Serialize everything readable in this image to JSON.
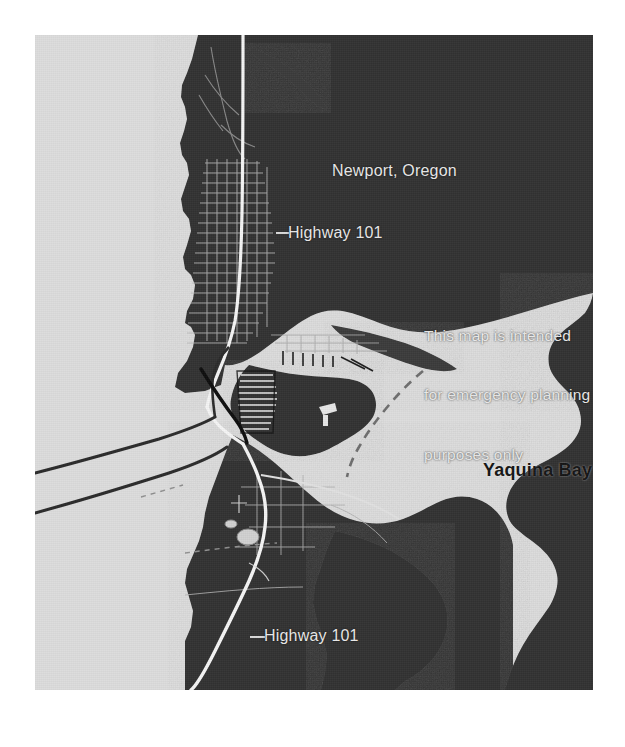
{
  "document": {
    "type": "scanned-map-figure",
    "page_background": "#ffffff"
  },
  "map": {
    "title": "Newport, Oregon",
    "region": "Newport, Oregon — Yaquina Bay",
    "frame": {
      "left": 35,
      "top": 35,
      "width": 558,
      "height": 655
    },
    "colors": {
      "land": "#333333",
      "water": "#dcdcdc",
      "road_highway": "#f2f2f2",
      "road_street": "#bdbdbd",
      "jetty": "#2a2a2a",
      "bridge": "#111111",
      "label_light": "#e9e9e9",
      "label_dark": "#151515",
      "page": "#ffffff"
    },
    "labels": {
      "city": "Newport, Oregon",
      "highway_north": "Highway 101",
      "highway_south": "Highway 101",
      "water_body": "Yaquina Bay",
      "disclaimer_line1": "This map is intended",
      "disclaimer_line2": "for emergency planning",
      "disclaimer_line3": "purposes only"
    },
    "features": [
      {
        "name": "pacific-ocean",
        "kind": "water",
        "position": "west"
      },
      {
        "name": "yaquina-bay",
        "kind": "water",
        "position": "southeast"
      },
      {
        "name": "newport-city-grid",
        "kind": "urban-street-grid",
        "position": "northwest"
      },
      {
        "name": "highway-101",
        "kind": "road",
        "orientation": "north-south"
      },
      {
        "name": "yaquina-bay-bridge",
        "kind": "bridge",
        "position": "bay-mouth"
      },
      {
        "name": "north-jetty",
        "kind": "jetty",
        "position": "bay-mouth-north"
      },
      {
        "name": "south-jetty",
        "kind": "jetty",
        "position": "bay-mouth-south"
      },
      {
        "name": "bayfront-docks",
        "kind": "piers",
        "position": "bay-north-shore"
      },
      {
        "name": "navigation-channel",
        "kind": "dashed-channel-line",
        "position": "bay-center"
      }
    ]
  }
}
